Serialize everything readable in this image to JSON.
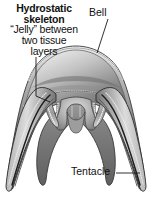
{
  "figure": {
    "background_color": "#ffffff",
    "line_color": "#1a1a1a",
    "tissue_dark": "#4a4a4a",
    "tissue_mid": "#8c8c8c",
    "tissue_light": "#c9c9c9",
    "jelly_fill": "#d8d8d8"
  },
  "labels": {
    "hydrostatic": {
      "line1": "Hydrostatic",
      "line2": "skeleton",
      "line3": "“Jelly” between",
      "line4": "two tissue",
      "line5": "layers"
    },
    "bell": {
      "text": "Bell"
    },
    "tentacle": {
      "text": "Tentacle"
    }
  },
  "leader_lines": {
    "hydrostatic": "vertical-then-right",
    "bell": "diagonal-down-left",
    "tentacle": "horizontal-right"
  },
  "anatomy_parts": [
    "bell",
    "mesoglea-jelly",
    "epidermis-layer",
    "gastrodermis-layer",
    "manubrium",
    "tentacle-left",
    "tentacle-right"
  ]
}
